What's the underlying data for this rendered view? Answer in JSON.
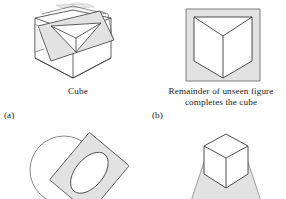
{
  "page": {
    "background_color": "#ffffff",
    "line_color": "#3a3a3a",
    "fill_gray": "#e2e2e2",
    "fill_white": "#ffffff",
    "text_color": "#1a1a1a"
  },
  "panels": [
    {
      "id": "a",
      "sublabel": "(a)",
      "caption": "Cube",
      "figure_name": "cube-with-tilted-panel-and-inverted-triangle"
    },
    {
      "id": "b",
      "sublabel": "(b)",
      "caption_line_1": "Remainder of unseen figure",
      "caption_line_2": "completes the cube",
      "figure_name": "gray-square-frame-with-inside-corner-cube"
    },
    {
      "id": "c",
      "figure_name": "circle-behind-tilted-rectangle-with-ellipse-hole"
    },
    {
      "id": "d",
      "figure_name": "white-box-in-front-of-gray-trapezoid"
    }
  ]
}
